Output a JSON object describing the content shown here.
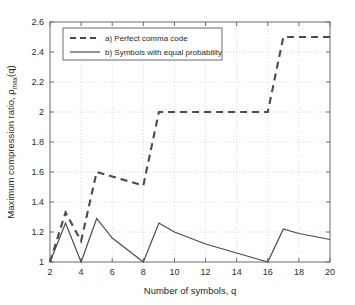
{
  "chart_data": {
    "type": "line",
    "title": "",
    "xlabel": "Number of symbols, q",
    "ylabel": "Maximum compression ratio, ρmax(q)",
    "ylabel_main": "Maximum compression ratio, ",
    "ylabel_rho": "ρ",
    "ylabel_sub": "max",
    "ylabel_tail": "(q)",
    "xlim": [
      2,
      20
    ],
    "ylim": [
      1,
      2.6
    ],
    "grid": true,
    "grid_style": "dotted",
    "legend_position": "upper-left",
    "xticks": [
      2,
      4,
      6,
      8,
      10,
      12,
      14,
      16,
      18,
      20
    ],
    "xtick_labels": [
      "2",
      "4",
      "6",
      "8",
      "10",
      "12",
      "14",
      "16",
      "18",
      "20"
    ],
    "yticks": [
      1,
      1.2,
      1.4,
      1.6,
      1.8,
      2,
      2.2,
      2.4,
      2.6
    ],
    "ytick_labels": [
      "1",
      "1.2",
      "1.4",
      "1.6",
      "1.8",
      "2",
      "2.2",
      "2.4",
      "2.6"
    ],
    "x": [
      2,
      3,
      4,
      5,
      6,
      7,
      8,
      9,
      10,
      11,
      12,
      13,
      14,
      15,
      16,
      17,
      18,
      19,
      20
    ],
    "series": [
      {
        "name": "a) Perfect comma code",
        "style": "dashed",
        "color": "#4a4a4a",
        "values": [
          1.0,
          1.33,
          1.14,
          1.6,
          1.57,
          1.54,
          1.51,
          2.0,
          2.0,
          2.0,
          2.0,
          2.0,
          2.0,
          2.0,
          2.0,
          2.5,
          2.5,
          2.5,
          2.5
        ]
      },
      {
        "name": "b) Symbols with equal probability",
        "style": "solid",
        "color": "#4a4a4a",
        "values": [
          1.0,
          1.26,
          1.0,
          1.29,
          1.16,
          1.08,
          1.0,
          1.26,
          1.2,
          1.16,
          1.12,
          1.09,
          1.06,
          1.03,
          1.0,
          1.22,
          1.19,
          1.17,
          1.15
        ]
      }
    ]
  },
  "legend": {
    "items": [
      {
        "label": "a) Perfect comma code",
        "style": "dashed"
      },
      {
        "label": "b) Symbols with equal probability",
        "style": "solid"
      }
    ]
  },
  "axes": {
    "x_title": "Number of symbols, q",
    "y_title_main": "Maximum compression ratio, ",
    "y_title_rho": "ρ",
    "y_title_sub": "max",
    "y_title_tail": "(q)"
  },
  "colors": {
    "line": "#4a4a4a",
    "axis": "#6b6b6b",
    "grid": "#cfcfcf",
    "text": "#1f1f1f",
    "background": "#ffffff"
  }
}
